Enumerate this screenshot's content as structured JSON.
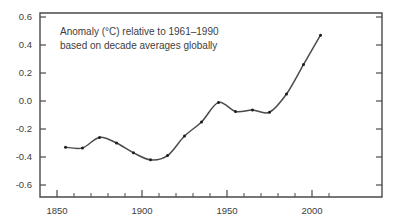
{
  "chart_data": {
    "type": "line",
    "title": "",
    "subtitle": "",
    "xlabel": "",
    "ylabel": "",
    "xlim": [
      1850,
      2012
    ],
    "ylim": [
      -0.7,
      0.62
    ],
    "grid": false,
    "legend_position": "none",
    "annotations": [
      "Anomaly (°C) relative to 1961–1990",
      "based on decade averages globally"
    ],
    "y_ticks": [
      0.6,
      0.4,
      0.2,
      0.0,
      -0.2,
      -0.4,
      -0.6
    ],
    "y_tick_labels": [
      "0.6",
      "0.4",
      "0.2",
      "0.0",
      "-0.2",
      "-0.4",
      "-0.6"
    ],
    "x_ticks_major": [
      1850,
      1900,
      1950,
      2000
    ],
    "x_tick_labels": [
      "1850",
      "1900",
      "1950",
      "2000"
    ],
    "x_ticks_minor": [
      1860,
      1870,
      1880,
      1890,
      1910,
      1920,
      1930,
      1940,
      1960,
      1970,
      1980,
      1990,
      2010
    ],
    "series": [
      {
        "name": "Global temperature anomaly",
        "marker": "dot",
        "color": "#4b4b4b",
        "x": [
          1855,
          1865,
          1875,
          1885,
          1895,
          1905,
          1915,
          1925,
          1935,
          1945,
          1955,
          1965,
          1975,
          1985,
          1995,
          2005
        ],
        "values": [
          -0.33,
          -0.335,
          -0.26,
          -0.3,
          -0.37,
          -0.42,
          -0.39,
          -0.25,
          -0.15,
          -0.01,
          -0.075,
          -0.065,
          -0.08,
          0.05,
          0.26,
          0.47
        ]
      }
    ]
  },
  "colors": {
    "axis": "#4a4a4a",
    "line": "#4b4b4b",
    "marker": "#1d1d1d",
    "text": "#3d3d3d",
    "background": "#ffffff"
  }
}
